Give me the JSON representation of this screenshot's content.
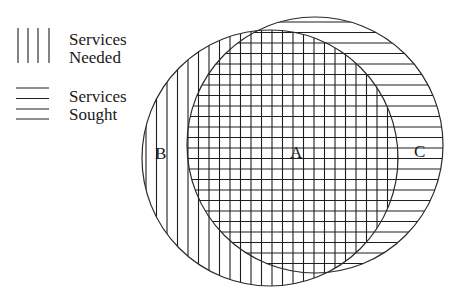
{
  "legend": {
    "items": [
      {
        "pattern": "vertical-lines",
        "line1": "Services",
        "line2": "Needed"
      },
      {
        "pattern": "horizontal-lines",
        "line1": "Services",
        "line2": "Sought"
      }
    ]
  },
  "diagram": {
    "type": "venn",
    "sets": [
      {
        "name": "Services Needed",
        "pattern": "vertical-lines",
        "cx": 270,
        "cy": 158,
        "r": 128
      },
      {
        "name": "Services Sought",
        "pattern": "horizontal-lines",
        "cx": 315,
        "cy": 145,
        "r": 128
      }
    ],
    "regions": [
      {
        "label": "A",
        "description": "Services needed and sought (overlap)"
      },
      {
        "label": "B",
        "description": "Services needed only"
      },
      {
        "label": "C",
        "description": "Services sought only"
      }
    ]
  },
  "colors": {
    "ink": "#1e1e1e",
    "background": "#ffffff"
  }
}
